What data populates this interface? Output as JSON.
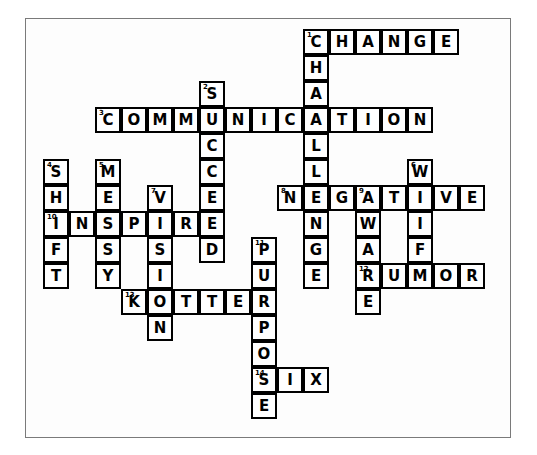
{
  "puzzle": {
    "type": "crossword",
    "cell_size": 26,
    "origin": {
      "x": 43,
      "y": 29
    },
    "border": {
      "color": "#7a7a7a",
      "x": 25,
      "y": 18,
      "width": 486,
      "height": 420
    },
    "cell_border_color": "#000000",
    "cell_fill": "#ffffff",
    "letter_color": "#000000",
    "entries": [
      {
        "number": 1,
        "answer": "CHANGE",
        "direction": "across",
        "row": 0,
        "col": 10
      },
      {
        "number": 1,
        "answer": "CHALLENGE",
        "direction": "down",
        "row": 0,
        "col": 10
      },
      {
        "number": 2,
        "answer": "SUCCEEDED",
        "direction": "down",
        "row": 2,
        "col": 6
      },
      {
        "number": 3,
        "answer": "COMMUNICATION",
        "direction": "across",
        "row": 3,
        "col": 2
      },
      {
        "number": 4,
        "answer": "SHIFT",
        "direction": "down",
        "row": 5,
        "col": 0
      },
      {
        "number": 5,
        "answer": "MESSY",
        "direction": "down",
        "row": 5,
        "col": 2
      },
      {
        "number": 6,
        "answer": "WIFE",
        "direction": "down",
        "row": 5,
        "col": 14
      },
      {
        "number": 7,
        "answer": "VISION",
        "direction": "down",
        "row": 6,
        "col": 4
      },
      {
        "number": 8,
        "answer": "NEGATIVE",
        "direction": "across",
        "row": 6,
        "col": 9
      },
      {
        "number": 9,
        "answer": "AWARE",
        "direction": "down",
        "row": 6,
        "col": 12
      },
      {
        "number": 10,
        "answer": "INSPIRE",
        "direction": "across",
        "row": 7,
        "col": 0
      },
      {
        "number": 11,
        "answer": "PURPOSE",
        "direction": "down",
        "row": 8,
        "col": 8
      },
      {
        "number": 12,
        "answer": "RUMOR",
        "direction": "across",
        "row": 9,
        "col": 12
      },
      {
        "number": 13,
        "answer": "KOTTER",
        "direction": "across",
        "row": 10,
        "col": 3
      },
      {
        "number": 14,
        "answer": "SIX",
        "direction": "across",
        "row": 13,
        "col": 8
      }
    ],
    "cells": [
      {
        "row": 0,
        "col": 10,
        "letter": "C",
        "num": "1"
      },
      {
        "row": 0,
        "col": 11,
        "letter": "H"
      },
      {
        "row": 0,
        "col": 12,
        "letter": "A"
      },
      {
        "row": 0,
        "col": 13,
        "letter": "N"
      },
      {
        "row": 0,
        "col": 14,
        "letter": "G"
      },
      {
        "row": 0,
        "col": 15,
        "letter": "E"
      },
      {
        "row": 1,
        "col": 10,
        "letter": "H"
      },
      {
        "row": 2,
        "col": 6,
        "letter": "S",
        "num": "2"
      },
      {
        "row": 2,
        "col": 10,
        "letter": "A"
      },
      {
        "row": 3,
        "col": 2,
        "letter": "C",
        "num": "3"
      },
      {
        "row": 3,
        "col": 3,
        "letter": "O"
      },
      {
        "row": 3,
        "col": 4,
        "letter": "M"
      },
      {
        "row": 3,
        "col": 5,
        "letter": "M"
      },
      {
        "row": 3,
        "col": 6,
        "letter": "U"
      },
      {
        "row": 3,
        "col": 7,
        "letter": "N"
      },
      {
        "row": 3,
        "col": 8,
        "letter": "I"
      },
      {
        "row": 3,
        "col": 9,
        "letter": "C"
      },
      {
        "row": 3,
        "col": 10,
        "letter": "A"
      },
      {
        "row": 3,
        "col": 11,
        "letter": "T"
      },
      {
        "row": 3,
        "col": 12,
        "letter": "I"
      },
      {
        "row": 3,
        "col": 13,
        "letter": "O"
      },
      {
        "row": 3,
        "col": 14,
        "letter": "N"
      },
      {
        "row": 4,
        "col": 6,
        "letter": "C"
      },
      {
        "row": 4,
        "col": 10,
        "letter": "L"
      },
      {
        "row": 5,
        "col": 0,
        "letter": "S",
        "num": "4"
      },
      {
        "row": 5,
        "col": 2,
        "letter": "M",
        "num": "5"
      },
      {
        "row": 5,
        "col": 6,
        "letter": "C"
      },
      {
        "row": 5,
        "col": 10,
        "letter": "L"
      },
      {
        "row": 5,
        "col": 14,
        "letter": "W",
        "num": "6"
      },
      {
        "row": 6,
        "col": 0,
        "letter": "H"
      },
      {
        "row": 6,
        "col": 2,
        "letter": "E"
      },
      {
        "row": 6,
        "col": 4,
        "letter": "V",
        "num": "7"
      },
      {
        "row": 6,
        "col": 6,
        "letter": "E"
      },
      {
        "row": 6,
        "col": 9,
        "letter": "N",
        "num": "8"
      },
      {
        "row": 6,
        "col": 10,
        "letter": "E"
      },
      {
        "row": 6,
        "col": 11,
        "letter": "G"
      },
      {
        "row": 6,
        "col": 12,
        "letter": "A",
        "num": "9"
      },
      {
        "row": 6,
        "col": 13,
        "letter": "T"
      },
      {
        "row": 6,
        "col": 14,
        "letter": "I"
      },
      {
        "row": 6,
        "col": 15,
        "letter": "V"
      },
      {
        "row": 6,
        "col": 16,
        "letter": "E"
      },
      {
        "row": 7,
        "col": 0,
        "letter": "I",
        "num": "10"
      },
      {
        "row": 7,
        "col": 1,
        "letter": "N"
      },
      {
        "row": 7,
        "col": 2,
        "letter": "S"
      },
      {
        "row": 7,
        "col": 3,
        "letter": "P"
      },
      {
        "row": 7,
        "col": 4,
        "letter": "I"
      },
      {
        "row": 7,
        "col": 5,
        "letter": "R"
      },
      {
        "row": 7,
        "col": 6,
        "letter": "E"
      },
      {
        "row": 7,
        "col": 10,
        "letter": "N"
      },
      {
        "row": 7,
        "col": 12,
        "letter": "W"
      },
      {
        "row": 7,
        "col": 14,
        "letter": "I"
      },
      {
        "row": 8,
        "col": 0,
        "letter": "F"
      },
      {
        "row": 8,
        "col": 2,
        "letter": "S"
      },
      {
        "row": 8,
        "col": 4,
        "letter": "S"
      },
      {
        "row": 8,
        "col": 6,
        "letter": "D"
      },
      {
        "row": 8,
        "col": 8,
        "letter": "P",
        "num": "11"
      },
      {
        "row": 8,
        "col": 10,
        "letter": "G"
      },
      {
        "row": 8,
        "col": 12,
        "letter": "A"
      },
      {
        "row": 8,
        "col": 14,
        "letter": "F"
      },
      {
        "row": 9,
        "col": 0,
        "letter": "T"
      },
      {
        "row": 9,
        "col": 2,
        "letter": "Y"
      },
      {
        "row": 9,
        "col": 4,
        "letter": "I"
      },
      {
        "row": 9,
        "col": 8,
        "letter": "U"
      },
      {
        "row": 9,
        "col": 10,
        "letter": "E"
      },
      {
        "row": 9,
        "col": 12,
        "letter": "R",
        "num": "12"
      },
      {
        "row": 9,
        "col": 13,
        "letter": "U"
      },
      {
        "row": 9,
        "col": 14,
        "letter": "M"
      },
      {
        "row": 9,
        "col": 15,
        "letter": "O"
      },
      {
        "row": 9,
        "col": 16,
        "letter": "R"
      },
      {
        "row": 10,
        "col": 3,
        "letter": "K",
        "num": "13"
      },
      {
        "row": 10,
        "col": 4,
        "letter": "O"
      },
      {
        "row": 10,
        "col": 5,
        "letter": "T"
      },
      {
        "row": 10,
        "col": 6,
        "letter": "T"
      },
      {
        "row": 10,
        "col": 7,
        "letter": "E"
      },
      {
        "row": 10,
        "col": 8,
        "letter": "R"
      },
      {
        "row": 10,
        "col": 12,
        "letter": "E"
      },
      {
        "row": 11,
        "col": 4,
        "letter": "N"
      },
      {
        "row": 11,
        "col": 8,
        "letter": "P"
      },
      {
        "row": 12,
        "col": 8,
        "letter": "O"
      },
      {
        "row": 13,
        "col": 8,
        "letter": "S",
        "num": "14"
      },
      {
        "row": 13,
        "col": 9,
        "letter": "I"
      },
      {
        "row": 13,
        "col": 10,
        "letter": "X"
      },
      {
        "row": 14,
        "col": 8,
        "letter": "E"
      }
    ]
  }
}
